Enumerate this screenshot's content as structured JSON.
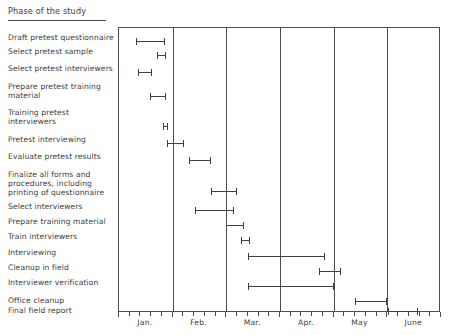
{
  "header": {
    "column_title": "Phase of the study"
  },
  "axis": {
    "months": [
      "Jan.",
      "Feb.",
      "Mar.",
      "Apr.",
      "May",
      "June"
    ],
    "ticks_per_month": 4,
    "xlabel": ""
  },
  "tasks": [
    {
      "label_lines": [
        "Draft pretest questionnaire"
      ],
      "start": 0.32,
      "end": 0.85
    },
    {
      "label_lines": [
        "Select pretest sample"
      ],
      "start": 0.7,
      "end": 0.87
    },
    {
      "label_lines": [
        "Select pretest interviewers"
      ],
      "start": 0.36,
      "end": 0.61
    },
    {
      "label_lines": [
        "Prepare pretest training",
        "material"
      ],
      "start": 0.58,
      "end": 0.88
    },
    {
      "label_lines": [
        "Training pretest",
        "interviewers"
      ],
      "start": 0.82,
      "end": 0.91
    },
    {
      "label_lines": [
        "Pretest interviewing"
      ],
      "start": 0.9,
      "end": 1.22
    },
    {
      "label_lines": [
        "Evaluate pretest results"
      ],
      "start": 1.3,
      "end": 1.72
    },
    {
      "label_lines": [
        "Finalize all forms and",
        "procedures, including",
        "printing of questionnaire"
      ],
      "start": 1.72,
      "end": 2.2
    },
    {
      "label_lines": [
        "Select interviewers"
      ],
      "start": 1.42,
      "end": 2.15
    },
    {
      "label_lines": [
        "Prepare training material"
      ],
      "start": 2.0,
      "end": 2.33
    },
    {
      "label_lines": [
        "Train interviewers"
      ],
      "start": 2.28,
      "end": 2.44
    },
    {
      "label_lines": [
        "Interviewing"
      ],
      "start": 2.4,
      "end": 3.84
    },
    {
      "label_lines": [
        "Cleanup in field"
      ],
      "start": 3.73,
      "end": 4.14
    },
    {
      "label_lines": [
        "Interviewer verification"
      ],
      "start": 2.4,
      "end": 4.0
    },
    {
      "label_lines": [
        "Office cleanup"
      ],
      "start": 4.4,
      "end": 5.0
    },
    {
      "label_lines": [
        "Final field report"
      ],
      "start": 5.02,
      "end": 5.57
    }
  ],
  "chart_data": {
    "type": "bar",
    "chart_subtype": "gantt",
    "title": "",
    "xlabel": "",
    "ylabel": "Phase of the study",
    "grid": true,
    "legend": "none",
    "x_axis": {
      "categories": [
        "Jan.",
        "Feb.",
        "Mar.",
        "Apr.",
        "May",
        "June"
      ],
      "unit": "month",
      "minor_ticks_per_category": 4,
      "range_months": [
        0,
        6
      ]
    },
    "categories": [
      "Draft pretest questionnaire",
      "Select pretest sample",
      "Select pretest interviewers",
      "Prepare pretest training material",
      "Training pretest interviewers",
      "Pretest interviewing",
      "Evaluate pretest results",
      "Finalize all forms and procedures, including printing of questionnaire",
      "Select interviewers",
      "Prepare training material",
      "Train interviewers",
      "Interviewing",
      "Cleanup in field",
      "Interviewer verification",
      "Office cleanup",
      "Final field report"
    ],
    "series": [
      {
        "name": "Schedule (months from start of Jan.)",
        "bars": [
          {
            "task": "Draft pretest questionnaire",
            "start": 0.32,
            "end": 0.85,
            "duration": 0.53
          },
          {
            "task": "Select pretest sample",
            "start": 0.7,
            "end": 0.87,
            "duration": 0.17
          },
          {
            "task": "Select pretest interviewers",
            "start": 0.36,
            "end": 0.61,
            "duration": 0.25
          },
          {
            "task": "Prepare pretest training material",
            "start": 0.58,
            "end": 0.88,
            "duration": 0.3
          },
          {
            "task": "Training pretest interviewers",
            "start": 0.82,
            "end": 0.91,
            "duration": 0.09
          },
          {
            "task": "Pretest interviewing",
            "start": 0.9,
            "end": 1.22,
            "duration": 0.32
          },
          {
            "task": "Evaluate pretest results",
            "start": 1.3,
            "end": 1.72,
            "duration": 0.42
          },
          {
            "task": "Finalize all forms and procedures, including printing of questionnaire",
            "start": 1.72,
            "end": 2.2,
            "duration": 0.48
          },
          {
            "task": "Select interviewers",
            "start": 1.42,
            "end": 2.15,
            "duration": 0.73
          },
          {
            "task": "Prepare training material",
            "start": 2.0,
            "end": 2.33,
            "duration": 0.33
          },
          {
            "task": "Train interviewers",
            "start": 2.28,
            "end": 2.44,
            "duration": 0.16
          },
          {
            "task": "Interviewing",
            "start": 2.4,
            "end": 3.84,
            "duration": 1.44
          },
          {
            "task": "Cleanup in field",
            "start": 3.73,
            "end": 4.14,
            "duration": 0.41
          },
          {
            "task": "Interviewer verification",
            "start": 2.4,
            "end": 4.0,
            "duration": 1.6
          },
          {
            "task": "Office cleanup",
            "start": 4.4,
            "end": 5.0,
            "duration": 0.6
          },
          {
            "task": "Final field report",
            "start": 5.02,
            "end": 5.57,
            "duration": 0.55
          }
        ]
      }
    ],
    "colors": {
      "bar": "#404040",
      "axis": "#4d4d4d",
      "text": "#3c3c3c",
      "background": "#ffffff"
    }
  }
}
